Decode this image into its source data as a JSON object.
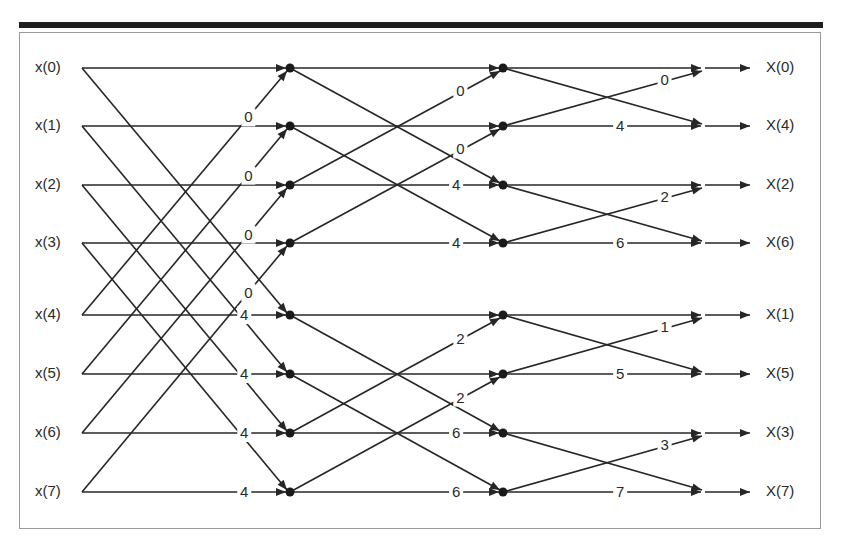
{
  "diagram": {
    "colors": {
      "line": "#262626",
      "node": "#1a1a1a",
      "text": "#2a2a2a",
      "frame": "#9a9a9a",
      "bar": "#1e1e1e"
    },
    "inputs": [
      "x(0)",
      "x(1)",
      "x(2)",
      "x(3)",
      "x(4)",
      "x(5)",
      "x(6)",
      "x(7)"
    ],
    "outputs": [
      "X(0)",
      "X(4)",
      "X(2)",
      "X(6)",
      "X(1)",
      "X(5)",
      "X(3)",
      "X(7)"
    ],
    "row_y": [
      68,
      126,
      185,
      243,
      315,
      374,
      433,
      492
    ],
    "stage1": {
      "pairs": [
        [
          0,
          4
        ],
        [
          1,
          5
        ],
        [
          2,
          6
        ],
        [
          3,
          7
        ]
      ],
      "cross_up_weights": [
        "0",
        "0",
        "0",
        "0"
      ],
      "straight_weights": [
        "",
        "",
        "",
        "",
        "4",
        "4",
        "4",
        "4"
      ]
    },
    "stage2": {
      "pairs": [
        [
          0,
          2
        ],
        [
          1,
          3
        ],
        [
          4,
          6
        ],
        [
          5,
          7
        ]
      ],
      "cross_up_weights": [
        "0",
        "0",
        "2",
        "2"
      ],
      "straight_weights": [
        "",
        "",
        "4",
        "4",
        "",
        "",
        "6",
        "6"
      ]
    },
    "stage3": {
      "pairs": [
        [
          0,
          1
        ],
        [
          2,
          3
        ],
        [
          4,
          5
        ],
        [
          6,
          7
        ]
      ],
      "cross_up_weights": [
        "0",
        "2",
        "1",
        "3"
      ],
      "straight_weights": [
        "",
        "4",
        "",
        "6",
        "",
        "5",
        "",
        "7"
      ]
    }
  }
}
